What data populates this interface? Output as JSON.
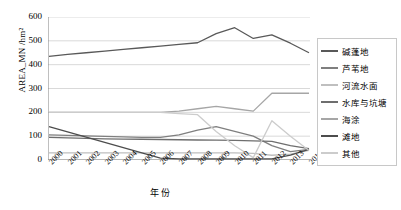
{
  "chart_data": {
    "type": "line",
    "title": "",
    "xlabel": "年份",
    "ylabel": "AREA_MN /hm²",
    "x": [
      "2000",
      "2001",
      "2002",
      "2003",
      "2004",
      "2005",
      "2006",
      "2007",
      "2008",
      "2009",
      "2010",
      "2011",
      "2012",
      "2013",
      "2014"
    ],
    "ylim": [
      0,
      600
    ],
    "yticks": [
      0,
      100,
      200,
      300,
      400,
      500,
      600
    ],
    "grid": true,
    "legend_position": "right",
    "series": [
      {
        "name": "碱蓬地",
        "color": "#595959",
        "values": [
          435,
          443,
          450,
          457,
          464,
          471,
          478,
          485,
          492,
          530,
          555,
          510,
          525,
          490,
          450
        ]
      },
      {
        "name": "芦苇地",
        "color": "#7f7f7f",
        "values": [
          105,
          103,
          101,
          99,
          97,
          95,
          95,
          105,
          125,
          140,
          120,
          100,
          60,
          35,
          45
        ]
      },
      {
        "name": "河流水面",
        "color": "#bfbfbf",
        "values": [
          30,
          30,
          30,
          30,
          30,
          30,
          30,
          30,
          30,
          30,
          30,
          28,
          20,
          25,
          40
        ]
      },
      {
        "name": "水库与坑塘",
        "color": "#6e6e6e",
        "values": [
          95,
          93,
          91,
          89,
          88,
          87,
          86,
          85,
          84,
          83,
          82,
          80,
          78,
          60,
          48
        ]
      },
      {
        "name": "海涂",
        "color": "#a6a6a6",
        "values": [
          200,
          200,
          200,
          200,
          200,
          200,
          200,
          205,
          215,
          225,
          215,
          205,
          280,
          280,
          280
        ]
      },
      {
        "name": "滩地",
        "color": "#4d4d4d",
        "values": [
          140,
          118,
          96,
          74,
          52,
          30,
          8,
          5,
          5,
          5,
          5,
          5,
          5,
          20,
          45
        ]
      },
      {
        "name": "其他",
        "color": "#cccccc",
        "values": [
          200,
          200,
          200,
          200,
          200,
          200,
          200,
          195,
          190,
          120,
          60,
          10,
          165,
          100,
          40
        ]
      }
    ]
  }
}
